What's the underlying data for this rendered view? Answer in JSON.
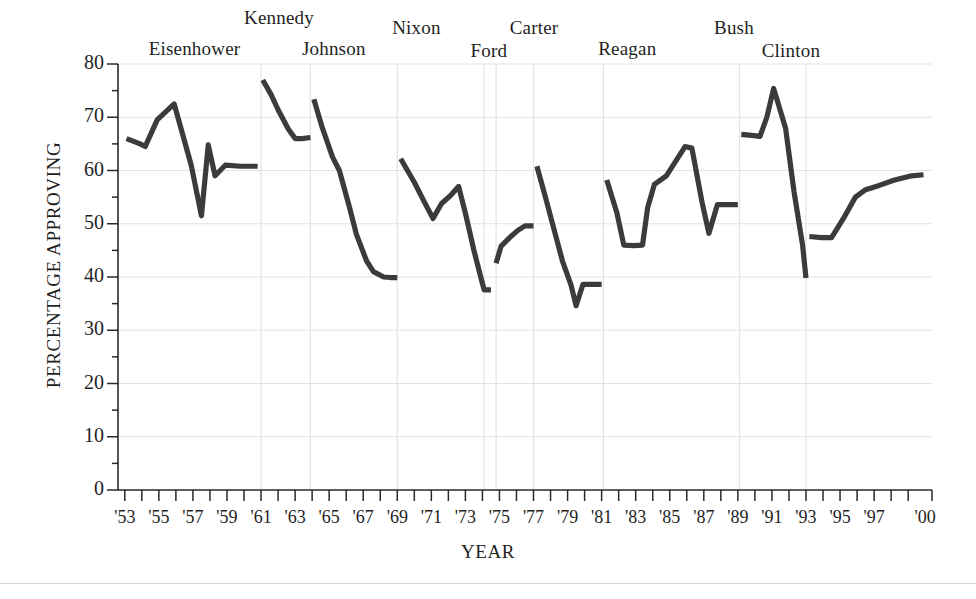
{
  "chart_data": {
    "type": "line",
    "title": "",
    "xlabel": "YEAR",
    "ylabel": "PERCENTAGE APPROVING",
    "ylim": [
      0,
      80
    ],
    "xlim": [
      1953,
      2000
    ],
    "ytick_values": [
      0,
      10,
      20,
      30,
      40,
      50,
      60,
      70,
      80
    ],
    "ytick_labels": [
      "0",
      "10",
      "20",
      "30",
      "40",
      "50",
      "60",
      "70",
      "80"
    ],
    "yminor_step": 5,
    "xtick_labels": [
      "'53",
      "'55",
      "'57",
      "'59",
      "'61",
      "'63",
      "'65",
      "'67",
      "'69",
      "'71",
      "'73",
      "'75",
      "'77",
      "'79",
      "'81",
      "'83",
      "'85",
      "'87",
      "'89",
      "'91",
      "'93",
      "'95",
      "'97",
      "'00"
    ],
    "xtick_years": [
      1953,
      1955,
      1957,
      1959,
      1961,
      1963,
      1965,
      1967,
      1969,
      1971,
      1973,
      1975,
      1977,
      1979,
      1981,
      1983,
      1985,
      1987,
      1989,
      1991,
      1993,
      1995,
      1997,
      2000
    ],
    "xminor_step": 1,
    "grid": "horizontal-and-vertical-light",
    "legend": "none",
    "line_color": "#3b3b3b",
    "grid_color": "#e3e3e3",
    "axis_color": "#2a2a2a",
    "annotations": [
      {
        "label": "Eisenhower",
        "x_year": 1954.4,
        "y_px": 38
      },
      {
        "label": "Kennedy",
        "x_year": 1960.0,
        "y_px": 7
      },
      {
        "label": "Johnson",
        "x_year": 1963.4,
        "y_px": 38
      },
      {
        "label": "Nixon",
        "x_year": 1968.7,
        "y_px": 17
      },
      {
        "label": "Ford",
        "x_year": 1973.3,
        "y_px": 40
      },
      {
        "label": "Carter",
        "x_year": 1975.6,
        "y_px": 17
      },
      {
        "label": "Reagan",
        "x_year": 1980.8,
        "y_px": 38
      },
      {
        "label": "Bush",
        "x_year": 1987.6,
        "y_px": 17
      },
      {
        "label": "Clinton",
        "x_year": 1990.4,
        "y_px": 40
      }
    ],
    "term_boundaries_years": [
      1961.0,
      1963.9,
      1969.0,
      1974.1,
      1974.8,
      1977.0,
      1981.1,
      1989.1,
      1993.0
    ],
    "series": [
      {
        "name": "Eisenhower",
        "points": [
          [
            1953.1,
            66.0
          ],
          [
            1953.9,
            65.0
          ],
          [
            1954.2,
            64.5
          ],
          [
            1954.9,
            69.5
          ],
          [
            1955.4,
            71.0
          ],
          [
            1955.9,
            72.5
          ],
          [
            1956.9,
            61.0
          ],
          [
            1957.5,
            51.5
          ],
          [
            1957.9,
            64.8
          ],
          [
            1958.3,
            59.0
          ],
          [
            1958.9,
            61.0
          ],
          [
            1959.8,
            60.8
          ],
          [
            1960.8,
            60.8
          ]
        ]
      },
      {
        "name": "Kennedy",
        "points": [
          [
            1961.1,
            77.0
          ],
          [
            1961.6,
            74.2
          ],
          [
            1962.0,
            71.4
          ],
          [
            1962.6,
            67.8
          ],
          [
            1963.0,
            66.0
          ],
          [
            1963.4,
            66.0
          ],
          [
            1963.9,
            66.2
          ]
        ]
      },
      {
        "name": "Johnson",
        "points": [
          [
            1964.1,
            73.4
          ],
          [
            1964.6,
            68.0
          ],
          [
            1965.2,
            62.5
          ],
          [
            1965.6,
            60.0
          ],
          [
            1966.2,
            53.0
          ],
          [
            1966.6,
            48.0
          ],
          [
            1967.2,
            43.0
          ],
          [
            1967.6,
            41.0
          ],
          [
            1968.2,
            40.0
          ],
          [
            1968.6,
            39.9
          ],
          [
            1969.0,
            39.9
          ]
        ]
      },
      {
        "name": "Nixon",
        "points": [
          [
            1969.2,
            62.2
          ],
          [
            1970.0,
            57.8
          ],
          [
            1970.6,
            54.0
          ],
          [
            1971.1,
            51.0
          ],
          [
            1971.6,
            53.8
          ],
          [
            1972.1,
            55.2
          ],
          [
            1972.6,
            57.0
          ],
          [
            1973.0,
            52.0
          ],
          [
            1973.5,
            45.0
          ],
          [
            1973.9,
            40.0
          ],
          [
            1974.1,
            37.6
          ],
          [
            1974.5,
            37.6
          ]
        ]
      },
      {
        "name": "Ford",
        "points": [
          [
            1974.8,
            42.6
          ],
          [
            1975.1,
            45.8
          ],
          [
            1975.6,
            47.4
          ],
          [
            1976.1,
            48.8
          ],
          [
            1976.5,
            49.6
          ],
          [
            1977.0,
            49.6
          ]
        ]
      },
      {
        "name": "Carter",
        "points": [
          [
            1977.2,
            60.8
          ],
          [
            1977.7,
            55.0
          ],
          [
            1978.2,
            49.0
          ],
          [
            1978.7,
            43.0
          ],
          [
            1979.2,
            38.5
          ],
          [
            1979.5,
            34.6
          ],
          [
            1979.9,
            38.6
          ],
          [
            1980.5,
            38.6
          ],
          [
            1981.0,
            38.6
          ]
        ]
      },
      {
        "name": "Reagan",
        "points": [
          [
            1981.3,
            58.2
          ],
          [
            1981.9,
            52.0
          ],
          [
            1982.3,
            46.0
          ],
          [
            1982.9,
            45.9
          ],
          [
            1983.4,
            46.0
          ],
          [
            1983.7,
            53.0
          ],
          [
            1984.1,
            57.4
          ],
          [
            1984.8,
            59.0
          ],
          [
            1985.4,
            62.0
          ],
          [
            1985.9,
            64.5
          ],
          [
            1986.3,
            64.2
          ],
          [
            1986.9,
            54.0
          ],
          [
            1987.3,
            48.2
          ],
          [
            1987.8,
            53.6
          ],
          [
            1988.4,
            53.6
          ],
          [
            1989.0,
            53.6
          ]
        ]
      },
      {
        "name": "Bush",
        "points": [
          [
            1989.2,
            66.8
          ],
          [
            1989.8,
            66.6
          ],
          [
            1990.3,
            66.4
          ],
          [
            1990.7,
            70.0
          ],
          [
            1991.1,
            75.4
          ],
          [
            1991.8,
            68.0
          ],
          [
            1992.3,
            56.0
          ],
          [
            1992.8,
            46.0
          ],
          [
            1993.0,
            39.8
          ]
        ]
      },
      {
        "name": "Clinton",
        "points": [
          [
            1993.2,
            47.6
          ],
          [
            1993.9,
            47.4
          ],
          [
            1994.5,
            47.4
          ],
          [
            1995.2,
            51.0
          ],
          [
            1995.9,
            55.0
          ],
          [
            1996.5,
            56.4
          ],
          [
            1997.3,
            57.2
          ],
          [
            1998.2,
            58.2
          ],
          [
            1999.2,
            59.0
          ],
          [
            1999.9,
            59.2
          ]
        ]
      }
    ]
  },
  "axes": {
    "ylabel": "PERCENTAGE APPROVING",
    "xlabel": "YEAR"
  }
}
